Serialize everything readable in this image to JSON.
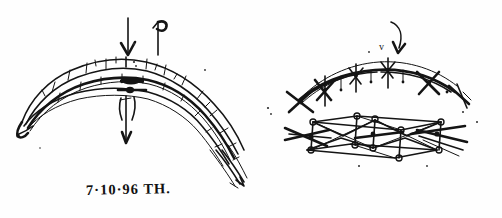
{
  "document": {
    "kind": "scanned-hand-drawn-sketch",
    "medium": "ink-on-paper",
    "background_color": "#ffffff",
    "ink_color": "#141414",
    "width": 502,
    "height": 218
  },
  "panels": [
    {
      "id": "left",
      "name": "arch-section-sketch",
      "description": "Segmented arched shell drawn in side elevation with ribs and load arrows",
      "caption": "7·10·96  TH.",
      "caption_parts": {
        "date": "7·10·96",
        "initials": "TH."
      },
      "annotations": [
        {
          "name": "load-arrow-down",
          "glyph": "down-arrow",
          "position": "above-crown"
        },
        {
          "name": "reaction-arrow-up",
          "glyph": "up-arrow-flag",
          "position": "above-crown-right"
        },
        {
          "name": "support-arrow-down",
          "glyph": "down-arrow",
          "position": "below-crown"
        }
      ]
    },
    {
      "id": "right",
      "name": "arch-plan-and-truss-sketch",
      "description": "Arched member in plan with cross bracing above a three-dimensional space truss lattice",
      "caption": "AW. 07 10 96.",
      "caption_parts": {
        "initials": "AW.",
        "date": "07 10 96."
      },
      "annotations": [
        {
          "name": "load-arrow-curved-down",
          "glyph": "curved-down-arrow",
          "label": "v",
          "position": "above-arch-crown"
        }
      ]
    }
  ],
  "captions": {
    "left": "7·10·96  TH.",
    "right": "AW. 07 10 96."
  }
}
